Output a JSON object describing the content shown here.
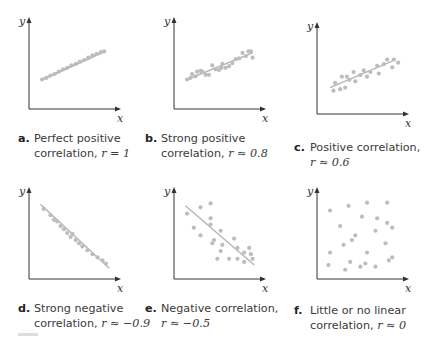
{
  "chart_data": [
    {
      "type": "scatter",
      "id": "a",
      "title": "Perfect positive correlation, r = 1",
      "caption_letter": "a.",
      "caption_line1": "Perfect positive",
      "caption_line2_prefix": "correlation, ",
      "caption_r": "r = 1",
      "xlabel": "x",
      "ylabel": "y",
      "r": 1,
      "fit_line": [
        [
          0.12,
          0.34
        ],
        [
          0.86,
          0.7
        ]
      ],
      "points": [
        [
          0.12,
          0.34
        ],
        [
          0.17,
          0.36
        ],
        [
          0.22,
          0.39
        ],
        [
          0.27,
          0.41
        ],
        [
          0.32,
          0.44
        ],
        [
          0.37,
          0.47
        ],
        [
          0.42,
          0.49
        ],
        [
          0.47,
          0.52
        ],
        [
          0.52,
          0.54
        ],
        [
          0.57,
          0.57
        ],
        [
          0.62,
          0.59
        ],
        [
          0.67,
          0.62
        ],
        [
          0.72,
          0.65
        ],
        [
          0.77,
          0.67
        ],
        [
          0.82,
          0.69
        ],
        [
          0.86,
          0.7
        ]
      ]
    },
    {
      "type": "scatter",
      "id": "b",
      "title": "Strong positive correlation, r ≈ 0.8",
      "caption_letter": "b.",
      "caption_line1": "Strong positive",
      "caption_line2_prefix": "correlation, ",
      "caption_r": "r ≈ 0.8",
      "xlabel": "x",
      "ylabel": "y",
      "r": 0.8,
      "fit_line": [
        [
          0.12,
          0.34
        ],
        [
          0.9,
          0.68
        ]
      ],
      "points": [
        [
          0.12,
          0.34
        ],
        [
          0.16,
          0.36
        ],
        [
          0.18,
          0.41
        ],
        [
          0.22,
          0.38
        ],
        [
          0.24,
          0.44
        ],
        [
          0.28,
          0.45
        ],
        [
          0.3,
          0.44
        ],
        [
          0.34,
          0.4
        ],
        [
          0.38,
          0.4
        ],
        [
          0.42,
          0.52
        ],
        [
          0.46,
          0.47
        ],
        [
          0.5,
          0.46
        ],
        [
          0.53,
          0.49
        ],
        [
          0.54,
          0.54
        ],
        [
          0.58,
          0.49
        ],
        [
          0.62,
          0.51
        ],
        [
          0.66,
          0.55
        ],
        [
          0.7,
          0.6
        ],
        [
          0.74,
          0.61
        ],
        [
          0.78,
          0.68
        ],
        [
          0.82,
          0.64
        ],
        [
          0.85,
          0.7
        ],
        [
          0.88,
          0.7
        ],
        [
          0.9,
          0.62
        ]
      ]
    },
    {
      "type": "scatter",
      "id": "c",
      "title": "Positive correlation, r ≈ 0.6",
      "caption_letter": "c.",
      "caption_line1": "Positive correlation,",
      "caption_line2_prefix": "",
      "caption_r": "r ≈ 0.6",
      "xlabel": "x",
      "ylabel": "y",
      "r": 0.6,
      "fit_line": [
        [
          0.12,
          0.3
        ],
        [
          0.9,
          0.66
        ]
      ],
      "points": [
        [
          0.16,
          0.26
        ],
        [
          0.18,
          0.36
        ],
        [
          0.24,
          0.28
        ],
        [
          0.26,
          0.44
        ],
        [
          0.3,
          0.3
        ],
        [
          0.32,
          0.44
        ],
        [
          0.35,
          0.4
        ],
        [
          0.4,
          0.5
        ],
        [
          0.42,
          0.38
        ],
        [
          0.48,
          0.46
        ],
        [
          0.52,
          0.52
        ],
        [
          0.56,
          0.44
        ],
        [
          0.6,
          0.5
        ],
        [
          0.68,
          0.58
        ],
        [
          0.7,
          0.48
        ],
        [
          0.76,
          0.6
        ],
        [
          0.8,
          0.66
        ],
        [
          0.86,
          0.56
        ],
        [
          0.88,
          0.66
        ],
        [
          0.93,
          0.62
        ]
      ]
    },
    {
      "type": "scatter",
      "id": "d",
      "title": "Strong negative correlation, r ≈ −0.9",
      "caption_letter": "d.",
      "caption_line1": "Strong negative",
      "caption_line2_prefix": "correlation, ",
      "caption_r": "r ≈ −0.9",
      "xlabel": "x",
      "ylabel": "y",
      "r": -0.9,
      "fit_line": [
        [
          0.1,
          0.92
        ],
        [
          0.92,
          0.1
        ]
      ],
      "points": [
        [
          0.14,
          0.86
        ],
        [
          0.22,
          0.78
        ],
        [
          0.26,
          0.72
        ],
        [
          0.3,
          0.7
        ],
        [
          0.34,
          0.64
        ],
        [
          0.38,
          0.6
        ],
        [
          0.42,
          0.55
        ],
        [
          0.46,
          0.5
        ],
        [
          0.48,
          0.54
        ],
        [
          0.52,
          0.46
        ],
        [
          0.56,
          0.42
        ],
        [
          0.6,
          0.38
        ],
        [
          0.66,
          0.33
        ],
        [
          0.72,
          0.28
        ],
        [
          0.78,
          0.24
        ],
        [
          0.84,
          0.2
        ],
        [
          0.88,
          0.16
        ]
      ]
    },
    {
      "type": "scatter",
      "id": "e",
      "title": "Negative correlation, r ≈ −0.5",
      "caption_letter": "e.",
      "caption_line1": "Negative correlation,",
      "caption_line2_prefix": "",
      "caption_r": "r ≈ −0.5",
      "xlabel": "x",
      "ylabel": "y",
      "r": -0.5,
      "fit_line": [
        [
          0.1,
          0.9
        ],
        [
          0.92,
          0.14
        ]
      ],
      "points": [
        [
          0.12,
          0.8
        ],
        [
          0.28,
          0.88
        ],
        [
          0.4,
          0.93
        ],
        [
          0.2,
          0.62
        ],
        [
          0.28,
          0.52
        ],
        [
          0.4,
          0.74
        ],
        [
          0.4,
          0.66
        ],
        [
          0.52,
          0.58
        ],
        [
          0.44,
          0.46
        ],
        [
          0.42,
          0.42
        ],
        [
          0.52,
          0.32
        ],
        [
          0.48,
          0.22
        ],
        [
          0.54,
          0.4
        ],
        [
          0.68,
          0.48
        ],
        [
          0.72,
          0.36
        ],
        [
          0.62,
          0.22
        ],
        [
          0.72,
          0.22
        ],
        [
          0.8,
          0.3
        ],
        [
          0.86,
          0.36
        ],
        [
          0.8,
          0.18
        ],
        [
          0.9,
          0.22
        ],
        [
          0.88,
          0.28
        ]
      ]
    },
    {
      "type": "scatter",
      "id": "f",
      "title": "Little or no linear correlation, r ≈ 0",
      "caption_letter": "f.",
      "caption_line1": "Little or no linear",
      "caption_line2_prefix": "correlation, ",
      "caption_r": "r ≈ 0",
      "xlabel": "x",
      "ylabel": "y",
      "r": 0,
      "fit_line": null,
      "points": [
        [
          0.12,
          0.84
        ],
        [
          0.34,
          0.9
        ],
        [
          0.56,
          0.94
        ],
        [
          0.8,
          0.94
        ],
        [
          0.5,
          0.76
        ],
        [
          0.68,
          0.74
        ],
        [
          0.8,
          0.68
        ],
        [
          0.24,
          0.64
        ],
        [
          0.66,
          0.58
        ],
        [
          0.42,
          0.52
        ],
        [
          0.86,
          0.62
        ],
        [
          0.28,
          0.4
        ],
        [
          0.38,
          0.46
        ],
        [
          0.78,
          0.42
        ],
        [
          0.12,
          0.3
        ],
        [
          0.56,
          0.3
        ],
        [
          0.86,
          0.24
        ],
        [
          0.36,
          0.18
        ],
        [
          0.54,
          0.16
        ],
        [
          0.1,
          0.14
        ],
        [
          0.3,
          0.08
        ],
        [
          0.48,
          0.12
        ],
        [
          0.66,
          0.12
        ],
        [
          0.82,
          0.2
        ]
      ]
    }
  ],
  "style": {
    "axis_color": "#333333",
    "point_color": "#bdbdbd",
    "line_color": "#b5b5b5"
  }
}
